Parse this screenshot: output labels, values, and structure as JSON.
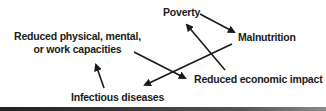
{
  "diagram": {
    "type": "cycle",
    "nodes": [
      {
        "id": "poverty",
        "label": "Poverty"
      },
      {
        "id": "malnutrition",
        "label": "Malnutrition"
      },
      {
        "id": "infectious",
        "label": "Infectious diseases"
      },
      {
        "id": "capacities",
        "label_line1": "Reduced physical, mental,",
        "label_line2": "or work capacities"
      },
      {
        "id": "economic",
        "label": "Reduced economic impact"
      }
    ],
    "edges": [
      {
        "from": "poverty",
        "to": "malnutrition"
      },
      {
        "from": "malnutrition",
        "to": "infectious"
      },
      {
        "from": "infectious",
        "to": "capacities"
      },
      {
        "from": "capacities",
        "to": "economic"
      },
      {
        "from": "economic",
        "to": "poverty"
      }
    ],
    "colors": {
      "text": "#1a1a1a",
      "arrow": "#1a1a1a",
      "background": "#ffffff"
    }
  }
}
